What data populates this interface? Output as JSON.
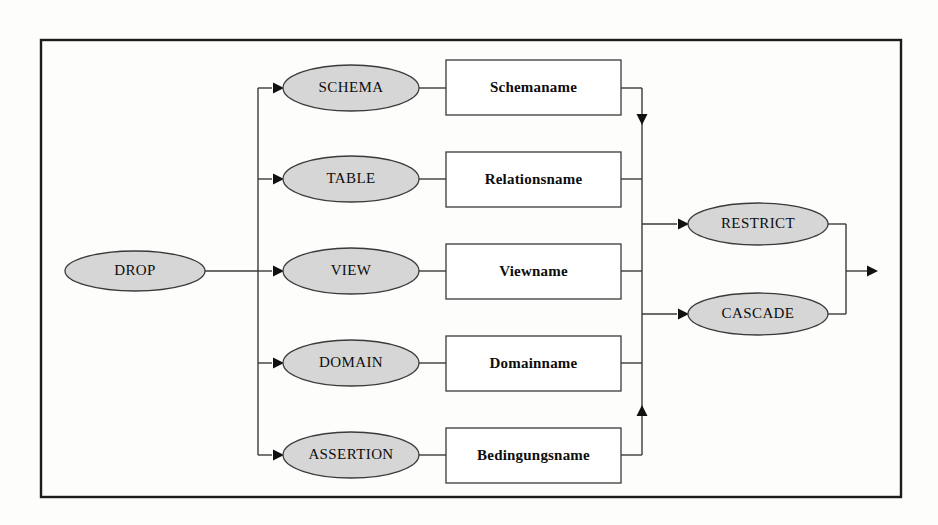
{
  "diagram": {
    "kind": "railroad-syntax-diagram",
    "title": "DROP",
    "language": "SQL",
    "colors": {
      "node_fill": "#d6d6d6",
      "node_stroke": "#3a3a3a",
      "box_fill": "#ffffff",
      "line": "#3a3a3a",
      "frame": "#1c1c1c",
      "text": "#0d0d0d",
      "background": "#fdfdfc"
    },
    "frame": {
      "x": 41,
      "y": 40,
      "width": 860,
      "height": 457
    },
    "start_node": {
      "label": "DROP",
      "shape": "ellipse",
      "cx": 135,
      "cy": 271,
      "rx": 70,
      "ry": 20
    },
    "branch_bus_x": 258,
    "merge_bus_x": 642,
    "tail_bus_x": 846,
    "exit_arrow_x": 878,
    "rows": [
      {
        "keyword": "SCHEMA",
        "operand": "Schemaname",
        "cy": 88,
        "oval": {
          "cx": 351,
          "cy": 88,
          "rx": 68,
          "ry": 23
        },
        "box": {
          "x": 446,
          "y": 60,
          "width": 175,
          "height": 55
        }
      },
      {
        "keyword": "TABLE",
        "operand": "Relationsname",
        "cy": 179,
        "oval": {
          "cx": 351,
          "cy": 179,
          "rx": 68,
          "ry": 23
        },
        "box": {
          "x": 446,
          "y": 152,
          "width": 175,
          "height": 55
        }
      },
      {
        "keyword": "VIEW",
        "operand": "Viewname",
        "cy": 271,
        "oval": {
          "cx": 351,
          "cy": 271,
          "rx": 68,
          "ry": 23
        },
        "box": {
          "x": 446,
          "y": 244,
          "width": 175,
          "height": 55
        }
      },
      {
        "keyword": "DOMAIN",
        "operand": "Domainname",
        "cy": 363,
        "oval": {
          "cx": 351,
          "cy": 363,
          "rx": 68,
          "ry": 23
        },
        "box": {
          "x": 446,
          "y": 336,
          "width": 175,
          "height": 55
        }
      },
      {
        "keyword": "ASSERTION",
        "operand": "Bedingungsname",
        "cy": 455,
        "oval": {
          "cx": 351,
          "cy": 455,
          "rx": 68,
          "ry": 23
        },
        "box": {
          "x": 446,
          "y": 428,
          "width": 175,
          "height": 55
        }
      }
    ],
    "terminal_options": [
      {
        "label": "RESTRICT",
        "oval": {
          "cx": 758,
          "cy": 224,
          "rx": 70,
          "ry": 21
        }
      },
      {
        "label": "CASCADE",
        "oval": {
          "cx": 758,
          "cy": 314,
          "rx": 70,
          "ry": 21
        }
      }
    ],
    "merge_arrowheads": [
      {
        "x": 642,
        "y": 125,
        "direction": "down"
      },
      {
        "x": 642,
        "y": 405,
        "direction": "up"
      }
    ]
  }
}
